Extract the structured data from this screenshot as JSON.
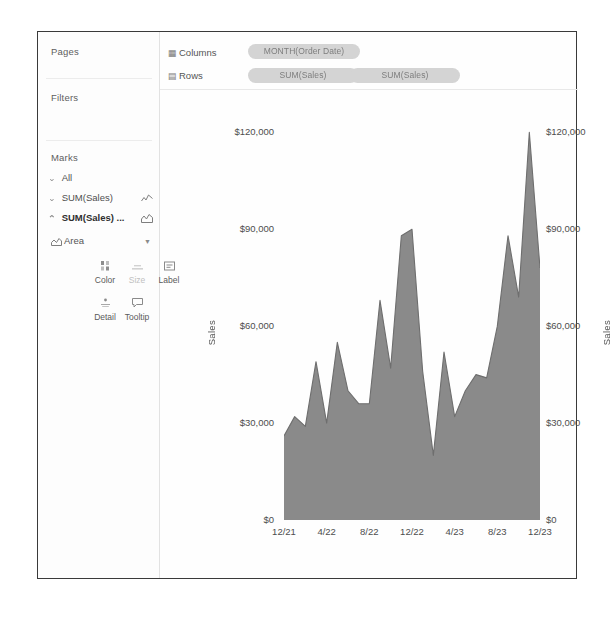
{
  "panel": {
    "pages_label": "Pages",
    "filters_label": "Filters",
    "marks_label": "Marks",
    "mark_rows": [
      {
        "label": "All",
        "chevron": "⌄",
        "glyph": ""
      },
      {
        "label": "SUM(Sales)",
        "chevron": "⌄",
        "glyph": "line-chart-icon"
      },
      {
        "label": "SUM(Sales) ...",
        "chevron": "⌃",
        "glyph": "area-chart-icon"
      }
    ],
    "mark_type": "Area",
    "encodings": [
      {
        "name": "Color",
        "icon": "color-palette-icon"
      },
      {
        "name": "Size",
        "icon": "size-icon"
      },
      {
        "name": "Label",
        "icon": "label-icon"
      },
      {
        "name": "Detail",
        "icon": "detail-icon"
      },
      {
        "name": "Tooltip",
        "icon": "tooltip-icon"
      }
    ]
  },
  "shelves": {
    "columns_label": "Columns",
    "rows_label": "Rows",
    "columns_pills": [
      "MONTH(Order Date)"
    ],
    "rows_pills": [
      "SUM(Sales)",
      "SUM(Sales)"
    ]
  },
  "colors": {
    "area_fill": "#8a8a8a",
    "area_line": "#6e6e6e",
    "pill": "#d4d4d4",
    "border": "#3a3a3a",
    "text": "#4d4d4d"
  },
  "chart_data": {
    "type": "area",
    "title": "",
    "xlabel": "",
    "ylabel": "Sales",
    "ylim": [
      0,
      130000
    ],
    "yticks": [
      0,
      30000,
      60000,
      90000,
      120000
    ],
    "ytick_labels": [
      "$0",
      "$30,000",
      "$60,000",
      "$90,000",
      "$120,000"
    ],
    "xtick_labels": [
      "12/21",
      "4/22",
      "8/22",
      "12/22",
      "4/23",
      "8/23",
      "12/23"
    ],
    "grid": false,
    "dual_axis": true,
    "legend": "none",
    "x": [
      "12/21",
      "1/22",
      "2/22",
      "3/22",
      "4/22",
      "5/22",
      "6/22",
      "7/22",
      "8/22",
      "9/22",
      "10/22",
      "11/22",
      "12/22",
      "1/23",
      "2/23",
      "3/23",
      "4/23",
      "5/23",
      "6/23",
      "7/23",
      "8/23",
      "9/23",
      "10/23",
      "11/23",
      "12/23"
    ],
    "series": [
      {
        "name": "SUM(Sales)",
        "values": [
          26000,
          32000,
          29000,
          49000,
          30000,
          55000,
          40000,
          36000,
          36000,
          68000,
          47000,
          88000,
          90000,
          46000,
          20000,
          52000,
          32000,
          40000,
          45000,
          44000,
          60000,
          88000,
          69000,
          120000,
          78000
        ]
      }
    ]
  }
}
